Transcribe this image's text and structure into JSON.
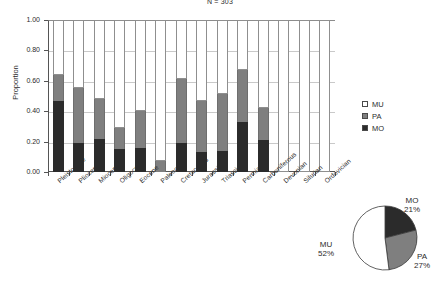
{
  "chart_data": {
    "type": "bar",
    "title": "N = 303",
    "xlabel": "",
    "ylabel": "Proportion",
    "ylim": [
      0.0,
      1.0
    ],
    "yticks": [
      "0.00",
      "0.20",
      "0.40",
      "0.60",
      "0.80",
      "1.00"
    ],
    "ytick_values": [
      0.0,
      0.2,
      0.4,
      0.6,
      0.8,
      1.0
    ],
    "grid": true,
    "stacked": true,
    "legend_position": "right",
    "categories": [
      "Pleistocene",
      "Pliocene",
      "Miocene",
      "Oligocene",
      "Eocene",
      "Paleocene",
      "Cretaceous",
      "Jurassic",
      "Triassic",
      "Permian",
      "Carboniferous",
      "Devonian",
      "Silurian",
      "Ordovician"
    ],
    "series": [
      {
        "name": "MO",
        "color": "#2b2b2b",
        "values": [
          0.47,
          0.19,
          0.22,
          0.15,
          0.16,
          0.0,
          0.19,
          0.13,
          0.14,
          0.33,
          0.21,
          0.0,
          0.0,
          0.0
        ]
      },
      {
        "name": "PA",
        "color": "#7f7f7f",
        "values": [
          0.17,
          0.36,
          0.26,
          0.14,
          0.24,
          0.07,
          0.42,
          0.34,
          0.37,
          0.34,
          0.21,
          0.0,
          0.0,
          0.0
        ]
      },
      {
        "name": "MU",
        "color": "#ffffff",
        "values": [
          0.36,
          0.45,
          0.52,
          0.71,
          0.6,
          0.93,
          0.39,
          0.53,
          0.49,
          0.33,
          0.58,
          1.0,
          1.0,
          1.0
        ]
      }
    ],
    "stack_tops": {
      "mo": [
        0.47,
        0.19,
        0.22,
        0.15,
        0.16,
        0.0,
        0.19,
        0.13,
        0.14,
        0.33,
        0.21,
        0.0,
        0.0,
        0.0
      ],
      "mo_plus_pa": [
        0.64,
        0.55,
        0.48,
        0.29,
        0.4,
        0.07,
        0.61,
        0.47,
        0.51,
        0.67,
        0.42,
        0.0,
        0.0,
        0.0
      ]
    },
    "legend": [
      {
        "key": "mu",
        "label": "MU",
        "color": "#ffffff"
      },
      {
        "key": "pa",
        "label": "PA",
        "color": "#7f7f7f"
      },
      {
        "key": "mo",
        "label": "MO",
        "color": "#2b2b2b"
      }
    ]
  },
  "pie_chart": {
    "type": "pie",
    "start_angle_deg": 0,
    "slices": [
      {
        "key": "mo",
        "label": "MO",
        "percent": 21,
        "percent_text": "21%",
        "color": "#2b2b2b"
      },
      {
        "key": "pa",
        "label": "PA",
        "percent": 27,
        "percent_text": "27%",
        "color": "#7f7f7f"
      },
      {
        "key": "mu",
        "label": "MU",
        "percent": 52,
        "percent_text": "52%",
        "color": "#ffffff"
      }
    ]
  }
}
